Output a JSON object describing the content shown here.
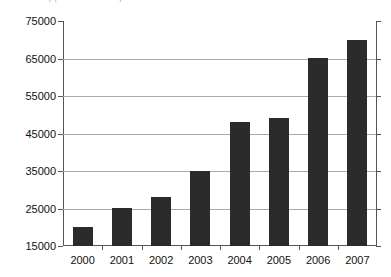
{
  "caption_sliver": {
    "text": "chart cropped above — partial text row"
  },
  "chart_data": {
    "type": "bar",
    "title": "",
    "subtitle": "",
    "xlabel": "",
    "ylabel": "",
    "categories": [
      "2000",
      "2001",
      "2002",
      "2003",
      "2004",
      "2005",
      "2006",
      "2007"
    ],
    "values": [
      20000,
      25000,
      28000,
      35000,
      48000,
      49000,
      65000,
      70000
    ],
    "series": [
      {
        "name": "",
        "values": [
          20000,
          25000,
          28000,
          35000,
          48000,
          49000,
          65000,
          70000
        ]
      }
    ],
    "ylim": [
      15000,
      75000
    ],
    "ytick_labels": [
      "15000",
      "25000",
      "35000",
      "45000",
      "55000",
      "65000",
      "75000"
    ],
    "ytick_values": [
      15000,
      25000,
      35000,
      45000,
      55000,
      65000,
      75000
    ],
    "ytick_step": 10000,
    "grid": true,
    "grid_axis": "y",
    "legend": false,
    "legend_position": "none",
    "bar_color": "#2b2b2b",
    "grid_color": "#a9a9a9",
    "axis_color": "#555555",
    "background_color": "#ffffff",
    "annotations": []
  }
}
